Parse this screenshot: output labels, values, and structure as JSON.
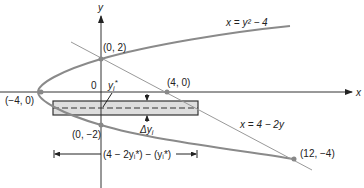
{
  "diagram": {
    "axes": {
      "x_label": "x",
      "y_label": "y",
      "origin_label": "0"
    },
    "curves": {
      "parabola": {
        "label": "x = y² − 4",
        "color": "#888888"
      },
      "line": {
        "label": "x = 4 − 2y",
        "color": "#999999"
      }
    },
    "points": [
      {
        "label": "(0, 2)",
        "x": 0,
        "y": 2
      },
      {
        "label": "(0, −2)",
        "x": 0,
        "y": -2
      },
      {
        "label": "(−4, 0)",
        "x": -4,
        "y": 0
      },
      {
        "label": "(4, 0)",
        "x": 4,
        "y": 0
      },
      {
        "label": "(12, −4)",
        "x": 12,
        "y": -4
      }
    ],
    "strip": {
      "sample_label": "y",
      "sample_sub": "i",
      "sample_sup": "*",
      "delta_label": "Δy",
      "delta_sub": "i",
      "fill": "#dddddd"
    },
    "width_annotation": {
      "label": "(4 − 2yᵢ*) − (yᵢ*)"
    }
  }
}
